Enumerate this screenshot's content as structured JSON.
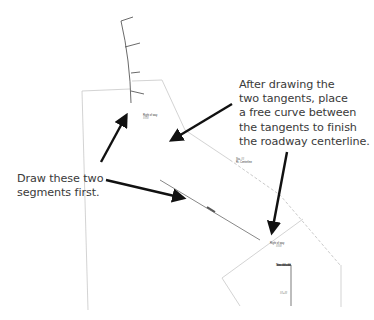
{
  "callouts": {
    "tangent_curve_instruction": "After drawing the\ntwo tangents, place\na free curve between\nthe tangents to finish\nthe roadway centerline.",
    "segments_instruction": "Draw these two\nsegments first."
  },
  "drawing": {
    "labels": {
      "upper_parcel": "Right of way",
      "upper_parcel_sub": "####",
      "mid_note": "Sta. ##",
      "mid_note_sub": "Rt. Centerline",
      "lower_parcel": "Right of way",
      "lower_parcel_sub": "####",
      "station_top": "Sta. ##+##",
      "station_mid": "##+##",
      "tangent_tag": "####"
    },
    "colors": {
      "annotation_arrow": "#111111",
      "property_line": "#bdbdbd",
      "centerline": "#444444",
      "text": "#3a3a3a"
    }
  }
}
